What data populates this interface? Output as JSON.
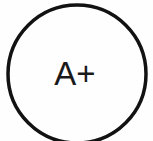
{
  "canvas": {
    "width": 153,
    "height": 141,
    "background_color": "#fefefe"
  },
  "badge": {
    "name": "a-plus-grade-badge",
    "label": "A+",
    "label_color": "#1a1a1a",
    "label_font_size": 33,
    "label_center_x": 75,
    "label_baseline_y": 85,
    "ring": {
      "shape": "circle",
      "center_x": 77,
      "center_y": 74,
      "radius": 69,
      "stroke_color": "#121212",
      "stroke_width": 3.5,
      "clipped_edge": "bottom"
    }
  }
}
